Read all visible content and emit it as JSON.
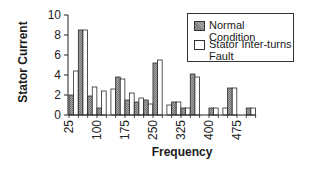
{
  "chart_data": {
    "type": "bar",
    "title": "",
    "xlabel": "Frequency",
    "ylabel": "Stator Current",
    "ylim": [
      0,
      10
    ],
    "yticks": [
      0,
      2,
      4,
      6,
      8,
      10
    ],
    "xtick_labels": [
      "25",
      "100",
      "175",
      "250",
      "325",
      "400",
      "475"
    ],
    "categories": [
      25,
      50,
      75,
      100,
      125,
      150,
      175,
      200,
      225,
      250,
      275,
      300,
      325,
      350,
      375,
      400,
      425,
      450,
      475,
      500
    ],
    "series": [
      {
        "name": "Normal Condition",
        "color": "#8c8c8c",
        "values": [
          2.0,
          8.5,
          1.9,
          0.7,
          0,
          3.8,
          1.5,
          1.3,
          1.5,
          5.2,
          0,
          1.3,
          0.7,
          4.1,
          0,
          0.7,
          0,
          2.7,
          0,
          0.7
        ]
      },
      {
        "name": "Stator Inter-turns Fault",
        "color": "#ffffff",
        "values": [
          4.4,
          8.5,
          2.8,
          2.4,
          2.6,
          3.6,
          2.2,
          1.7,
          1.1,
          5.5,
          1.0,
          1.3,
          0.7,
          3.8,
          0,
          0.7,
          0.7,
          2.7,
          0,
          0.7
        ]
      }
    ],
    "legend_position": "upper right",
    "grid": false
  },
  "legend": {
    "normal_label": "Normal Condition",
    "fault_label_line1": "Stator Inter-turns",
    "fault_label_line2": "Fault"
  },
  "axes": {
    "xlabel": "Frequency",
    "ylabel": "Stator Current"
  }
}
